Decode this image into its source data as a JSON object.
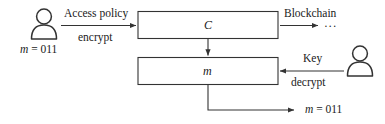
{
  "diagram": {
    "colors": {
      "stroke": "#333333",
      "text": "#1a1a1a",
      "background": "#ffffff"
    },
    "actors": [
      {
        "id": "data-owner",
        "icon": "person-icon",
        "label": "m = 011",
        "label_var": "m",
        "label_rest": " = 011"
      },
      {
        "id": "data-user",
        "icon": "person-icon",
        "label": ""
      }
    ],
    "boxes": [
      {
        "id": "ciphertext-box",
        "label": "C"
      },
      {
        "id": "message-box",
        "label": "m"
      }
    ],
    "edges": [
      {
        "id": "encrypt-edge",
        "label_above": "Access policy",
        "label_below": "encrypt"
      },
      {
        "id": "blockchain-edge",
        "label_above": "Blockchain",
        "trailing": "···"
      },
      {
        "id": "decrypt-edge",
        "label_above": "Key",
        "label_below": "decrypt"
      },
      {
        "id": "output-edge",
        "label": "m = 011",
        "label_var": "m",
        "label_rest": " = 011"
      }
    ]
  }
}
